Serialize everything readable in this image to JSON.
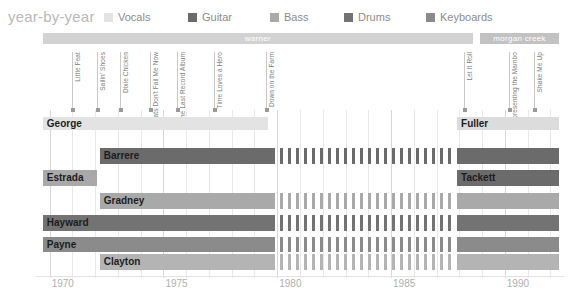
{
  "header": {
    "title": "year-by-year",
    "legend": [
      {
        "label": "Vocals",
        "color": "#e3e3e3",
        "x": 0
      },
      {
        "label": "Guitar",
        "color": "#6b6b6b",
        "x": 84
      },
      {
        "label": "Bass",
        "color": "#a9a9a9",
        "x": 166
      },
      {
        "label": "Drums",
        "color": "#737373",
        "x": 240
      },
      {
        "label": "Keyboards",
        "color": "#8b8b8b",
        "x": 322
      }
    ]
  },
  "chart_data": {
    "type": "bar",
    "title": "year-by-year",
    "xlabel": "",
    "ylabel": "",
    "xlim": [
      1969.4,
      1992.6
    ],
    "grid": true,
    "legend_position": "top",
    "categories": [
      "Vocals",
      "Guitar",
      "Bass",
      "Drums",
      "Keyboards"
    ],
    "series": [
      {
        "name": "Vocals",
        "color": "#e3e3e3"
      },
      {
        "name": "Guitar",
        "color": "#6b6b6b"
      },
      {
        "name": "Bass",
        "color": "#a9a9a9"
      },
      {
        "name": "Drums",
        "color": "#737373"
      },
      {
        "name": "Keyboards",
        "color": "#8b8b8b"
      }
    ],
    "xticks": [
      1970,
      1975,
      1980,
      1985,
      1990
    ],
    "xtick_labels": [
      "1970",
      "1975",
      "1980",
      "1985",
      "1990"
    ],
    "labels_bars": [
      {
        "name": "warner",
        "start": 1969.7,
        "end": 1988.6,
        "color": "#d2d2d2"
      },
      {
        "name": "morgan creek",
        "start": 1988.9,
        "end": 1992.4,
        "color": "#c2c2c2"
      }
    ],
    "albums": [
      {
        "title": "Little Feat",
        "year": 1971.0
      },
      {
        "title": "Sailin' Shoes",
        "year": 1972.1
      },
      {
        "title": "Dixie Chicken",
        "year": 1973.1
      },
      {
        "title": "Feats Don't Fail Me Now",
        "year": 1974.4
      },
      {
        "title": "The Last Record Album",
        "year": 1975.6
      },
      {
        "title": "Time Loves a Hero",
        "year": 1977.2
      },
      {
        "title": "Down on the Farm",
        "year": 1979.5
      },
      {
        "title": "Let It Roll",
        "year": 1988.2
      },
      {
        "title": "Representing the Mambo",
        "year": 1990.2
      },
      {
        "title": "Shake Me Up",
        "year": 1991.3
      }
    ],
    "members": [
      {
        "name": "George",
        "instrument": "Vocals",
        "color": "#e3e3e3",
        "row": 0,
        "segments": [
          {
            "start": 1969.7,
            "end": 1979.6,
            "style": "solid"
          }
        ]
      },
      {
        "name": "Barrere",
        "instrument": "Guitar",
        "color": "#6b6b6b",
        "row": 1,
        "segments": [
          {
            "start": 1972.2,
            "end": 1979.9,
            "style": "solid"
          },
          {
            "start": 1980.1,
            "end": 1987.7,
            "style": "dashed"
          },
          {
            "start": 1987.9,
            "end": 1992.4,
            "style": "solid"
          }
        ]
      },
      {
        "name": "Estrada",
        "instrument": "Bass",
        "color": "#a9a9a9",
        "row": 2,
        "segments": [
          {
            "start": 1969.7,
            "end": 1972.1,
            "style": "solid"
          }
        ]
      },
      {
        "name": "Gradney",
        "instrument": "Bass",
        "color": "#a9a9a9",
        "row": 3,
        "segments": [
          {
            "start": 1972.2,
            "end": 1979.9,
            "style": "solid"
          },
          {
            "start": 1980.1,
            "end": 1987.7,
            "style": "dashed"
          },
          {
            "start": 1987.9,
            "end": 1992.4,
            "style": "solid"
          }
        ]
      },
      {
        "name": "Hayward",
        "instrument": "Drums",
        "color": "#737373",
        "row": 4,
        "segments": [
          {
            "start": 1969.7,
            "end": 1979.9,
            "style": "solid"
          },
          {
            "start": 1980.1,
            "end": 1987.7,
            "style": "dashed"
          },
          {
            "start": 1987.9,
            "end": 1992.4,
            "style": "solid"
          }
        ]
      },
      {
        "name": "Payne",
        "instrument": "Keyboards",
        "color": "#8b8b8b",
        "row": 5,
        "segments": [
          {
            "start": 1969.7,
            "end": 1979.9,
            "style": "solid"
          },
          {
            "start": 1980.1,
            "end": 1987.7,
            "style": "dashed"
          },
          {
            "start": 1987.9,
            "end": 1992.4,
            "style": "solid"
          }
        ]
      },
      {
        "name": "Clayton",
        "instrument": "Keyboards",
        "color": "#b4b4b4",
        "row": 6,
        "segments": [
          {
            "start": 1972.2,
            "end": 1979.9,
            "style": "solid"
          },
          {
            "start": 1980.1,
            "end": 1987.7,
            "style": "dashed"
          },
          {
            "start": 1987.9,
            "end": 1992.4,
            "style": "solid"
          }
        ]
      },
      {
        "name": "Fuller",
        "instrument": "Vocals",
        "color": "#dcdcdc",
        "row": 0,
        "segments": [
          {
            "start": 1987.9,
            "end": 1992.4,
            "style": "solid"
          }
        ]
      },
      {
        "name": "Tackett",
        "instrument": "Guitar",
        "color": "#6b6b6b",
        "row": 2,
        "segments": [
          {
            "start": 1987.9,
            "end": 1992.4,
            "style": "solid"
          }
        ]
      }
    ]
  }
}
